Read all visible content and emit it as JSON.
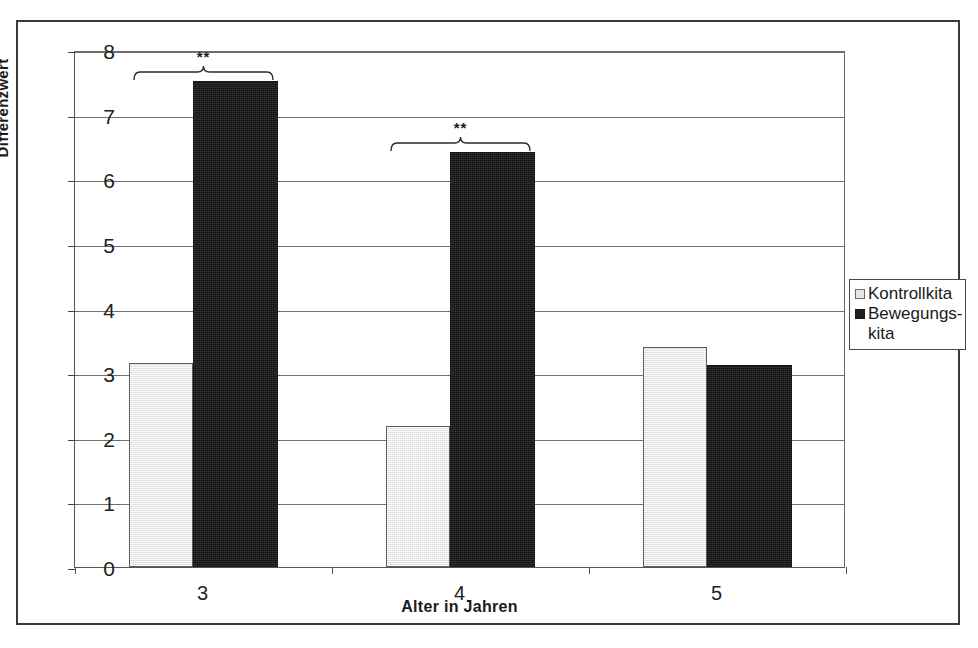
{
  "chart_data": {
    "type": "bar",
    "title": "",
    "subtitle": "",
    "xlabel": "Alter in Jahren",
    "ylabel": "Differenzwert",
    "categories": [
      "3",
      "4",
      "5"
    ],
    "ylim": [
      0,
      8
    ],
    "ytick_labels": [
      "0",
      "1",
      "2",
      "3",
      "4",
      "5",
      "6",
      "7",
      "8"
    ],
    "ytick_values": [
      0,
      1,
      2,
      3,
      4,
      5,
      6,
      7,
      8
    ],
    "grid": "horizontal",
    "legend_position": "right",
    "series": [
      {
        "name": "Kontrollkita",
        "color": "#e9e9e9",
        "values": [
          3.15,
          2.18,
          3.4
        ]
      },
      {
        "name": "Bewegungs-kita",
        "color": "#1f1f1f",
        "values": [
          7.52,
          6.42,
          3.12
        ]
      }
    ],
    "annotations": [
      {
        "category": "3",
        "text": "**",
        "type": "significance-bracket"
      },
      {
        "category": "4",
        "text": "**",
        "type": "significance-bracket"
      }
    ]
  },
  "legend": {
    "entries": [
      {
        "label": "Kontrollkita",
        "continuation": ""
      },
      {
        "label": "Bewegungs-",
        "continuation": "kita"
      }
    ]
  },
  "axes": {
    "y_title": "Differenzwert",
    "x_title": "Alter in Jahren"
  }
}
